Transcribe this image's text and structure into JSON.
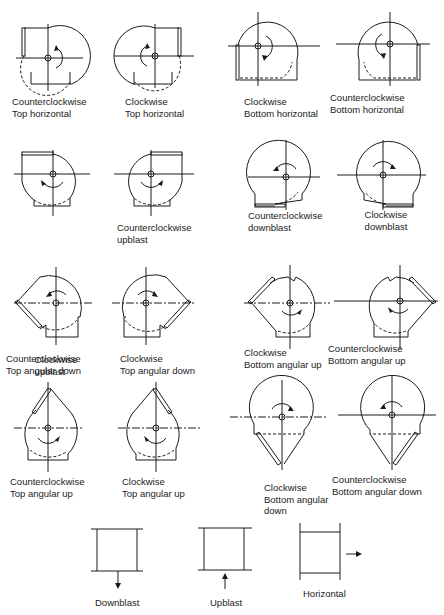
{
  "diagram": {
    "type": "fan-rotation-and-discharge-designations",
    "figures": [
      {
        "id": "ccw-top-horizontal",
        "label": [
          "Counterclockwise",
          "Top horizontal"
        ]
      },
      {
        "id": "cw-top-horizontal",
        "label": [
          "Clockwise",
          "Top horizontal"
        ]
      },
      {
        "id": "cw-bottom-horizontal",
        "label": [
          "Clockwise",
          "Bottom horizontal"
        ]
      },
      {
        "id": "ccw-bottom-horizontal",
        "label": [
          "Counterclockwise",
          "Bottom horizontal"
        ]
      },
      {
        "id": "cw-upblast",
        "label": [
          "Clockwise",
          "upblast"
        ]
      },
      {
        "id": "ccw-upblast",
        "label": [
          "Counterclockwise",
          "upblast"
        ]
      },
      {
        "id": "ccw-downblast",
        "label": [
          "Counterclockwise",
          "downblast"
        ]
      },
      {
        "id": "cw-downblast",
        "label": [
          "Clockwise",
          "downblast"
        ]
      },
      {
        "id": "ccw-top-angular-down",
        "label": [
          "Counterclockwise",
          "Top angular down"
        ]
      },
      {
        "id": "cw-top-angular-down",
        "label": [
          "Clockwise",
          "Top angular down"
        ]
      },
      {
        "id": "cw-bottom-angular-up",
        "label": [
          "Clockwise",
          "Bottom angular up"
        ]
      },
      {
        "id": "ccw-bottom-angular-up",
        "label": [
          "Counterclockwise",
          "Bottom angular up"
        ]
      },
      {
        "id": "ccw-top-angular-up",
        "label": [
          "Counterclockwise",
          "Top angular up"
        ]
      },
      {
        "id": "cw-top-angular-up",
        "label": [
          "Clockwise",
          "Top angular up"
        ]
      },
      {
        "id": "cw-bottom-angular-down",
        "label": [
          "Clockwise",
          "Bottom angular",
          "down"
        ]
      },
      {
        "id": "ccw-bottom-angular-down",
        "label": [
          "Counterclockwise",
          "Bottom angular down"
        ]
      }
    ],
    "discharge_types": [
      {
        "id": "downblast",
        "label": "Downblast"
      },
      {
        "id": "upblast",
        "label": "Upblast"
      },
      {
        "id": "horizontal",
        "label": "Horizontal"
      }
    ]
  }
}
